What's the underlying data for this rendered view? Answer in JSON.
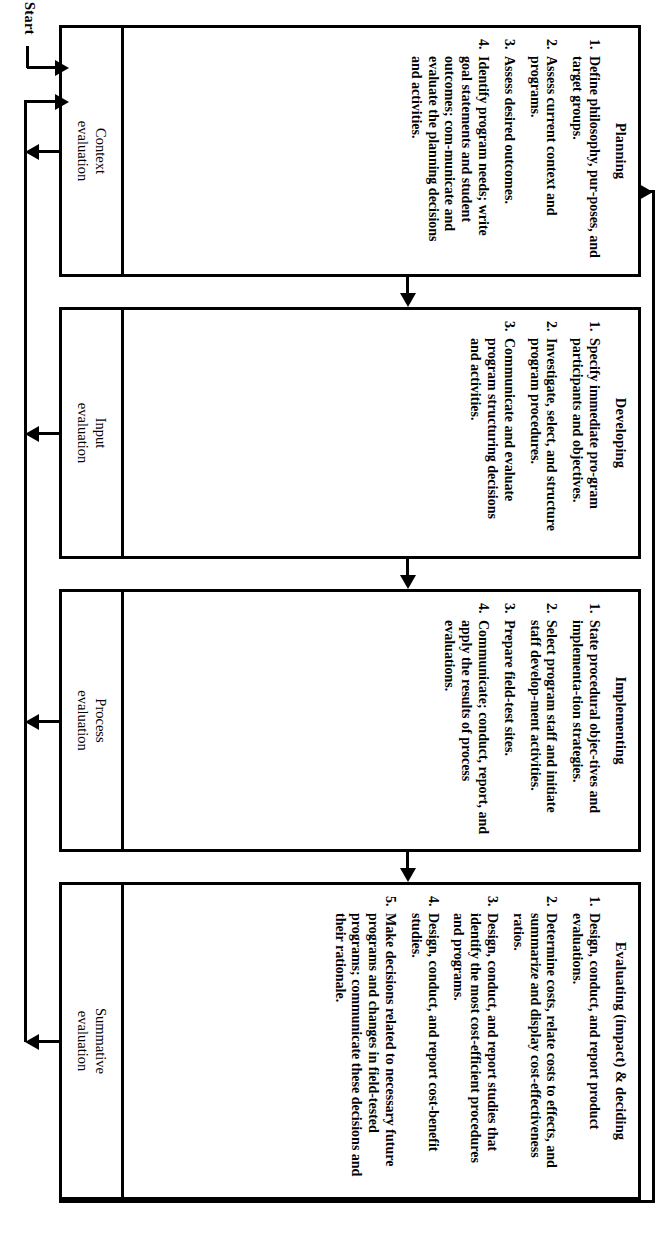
{
  "diagram": {
    "start_label": "Start",
    "caption": "Feedback loop",
    "panels": [
      {
        "id": "planning",
        "title": "Planning",
        "evaluation": "Context\nevaluation",
        "evaluation_line1": "Context",
        "evaluation_line2": "evaluation",
        "steps": [
          {
            "num": "1.",
            "text": "Define philosophy, pur‐poses, and target groups."
          },
          {
            "num": "2.",
            "text": "Assess current context and programs."
          },
          {
            "num": "3.",
            "text": "Assess desired outcomes."
          },
          {
            "num": "4.",
            "text": "Identify program needs; write goal statements and student outcomes; com‐municate and evaluate the planning decisions and activities."
          }
        ]
      },
      {
        "id": "developing",
        "title": "Developing",
        "evaluation": "Input\nevaluation",
        "evaluation_line1": "Input",
        "evaluation_line2": "evaluation",
        "steps": [
          {
            "num": "1.",
            "text": "Specify immediate pro‐gram participants and objectives."
          },
          {
            "num": "2.",
            "text": "Investigate, select, and structure program procedures."
          },
          {
            "num": "3.",
            "text": "Communicate and evaluate program structuring decisions and activities."
          }
        ]
      },
      {
        "id": "implementing",
        "title": "Implementing",
        "evaluation": "Process\nevaluation",
        "evaluation_line1": "Process",
        "evaluation_line2": "evaluation",
        "steps": [
          {
            "num": "1.",
            "text": "State procedural objec‐tives and implementa‐tion strategies."
          },
          {
            "num": "2.",
            "text": "Select program staff and initiate staff develop‐ment activities."
          },
          {
            "num": "3.",
            "text": "Prepare field-test sites."
          },
          {
            "num": "4.",
            "text": "Communicate; conduct, report, and apply the results of process evaluations."
          }
        ]
      },
      {
        "id": "evaluating",
        "title": "Evaluating (impact) & deciding",
        "evaluation": "Summative\nevaluation",
        "evaluation_line1": "Summative",
        "evaluation_line2": "evaluation",
        "steps": [
          {
            "num": "1.",
            "text": "Design, conduct, and report product evaluations."
          },
          {
            "num": "2.",
            "text": "Determine costs, relate costs to effects, and summarize and display cost-effectiveness ratios."
          },
          {
            "num": "3.",
            "text": "Design, conduct, and report studies that identify the most cost-efficient procedures and programs."
          },
          {
            "num": "4.",
            "text": "Design, conduct, and report cost-benefit studies."
          },
          {
            "num": "5.",
            "text": "Make decisions related to necessary future programs and changes in field-tested programs; communicate these decisions and their rationale."
          }
        ]
      }
    ],
    "colors": {
      "ink": "#000000",
      "paper": "#ffffff"
    }
  }
}
